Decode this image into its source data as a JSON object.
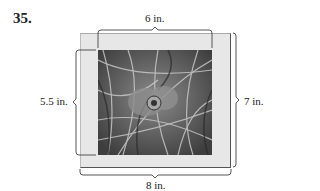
{
  "problem": {
    "number": "35."
  },
  "figure": {
    "type": "framed photo with dimension braces",
    "labels": {
      "photo_width": "6 in.",
      "photo_height": "5.5 in.",
      "frame_height": "7 in.",
      "frame_width": "8 in."
    },
    "colors": {
      "frame": "#e7e7e7",
      "photo_base": "#6a6a6a",
      "line": "#444444"
    }
  }
}
